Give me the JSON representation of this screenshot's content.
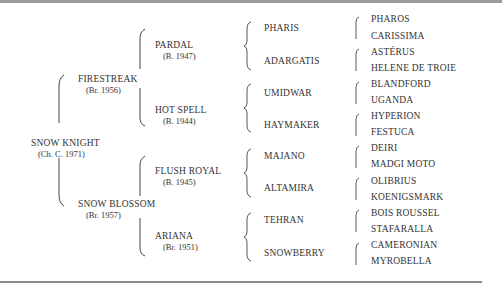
{
  "subject": {
    "name": "SNOW KNIGHT",
    "detail": "(Ch. C. 1971)"
  },
  "parents": [
    {
      "name": "FIRESTREAK",
      "detail": "(Br. 1956)"
    },
    {
      "name": "SNOW BLOSSOM",
      "detail": "(Br. 1957)"
    }
  ],
  "grandparents": [
    {
      "name": "PARDAL",
      "detail": "(B. 1947)"
    },
    {
      "name": "HOT SPELL",
      "detail": "(B. 1944)"
    },
    {
      "name": "FLUSH ROYAL",
      "detail": "(B. 1945)"
    },
    {
      "name": "ARIANA",
      "detail": "(Br. 1951)"
    }
  ],
  "great_grandparents": [
    "PHARIS",
    "ADARGATIS",
    "UMIDWAR",
    "HAYMAKER",
    "MAJANO",
    "ALTAMIRA",
    "TEHRAN",
    "SNOWBERRY"
  ],
  "great_great_grandparents": [
    "PHAROS",
    "CARISSIMA",
    "ASTÉRUS",
    "HELENE DE TROIE",
    "BLANDFORD",
    "UGANDA",
    "HYPERION",
    "FESTUCA",
    "DEIRI",
    "MADGI MOTO",
    "OLIBRIUS",
    "KOENIGSMARK",
    "BOIS ROUSSEL",
    "STAFARALLA",
    "CAMERONIAN",
    "MYROBELLA"
  ]
}
